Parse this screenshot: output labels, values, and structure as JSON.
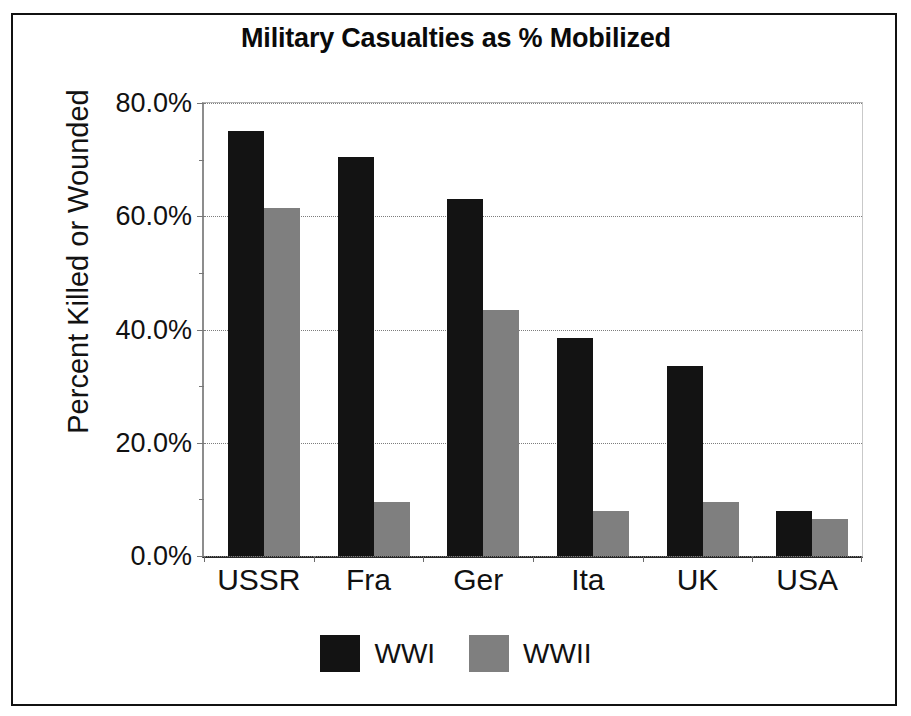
{
  "chart_data": {
    "type": "bar",
    "title": "Military Casualties as % Mobilized",
    "xlabel": "",
    "ylabel": "Percent Killed or Wounded",
    "categories": [
      "USSR",
      "Fra",
      "Ger",
      "Ita",
      "UK",
      "USA"
    ],
    "series": [
      {
        "name": "WWI",
        "color": "#131313",
        "values": [
          75.0,
          70.5,
          63.0,
          38.5,
          33.5,
          8.0
        ]
      },
      {
        "name": "WWII",
        "color": "#7f7f7f",
        "values": [
          61.5,
          9.5,
          43.5,
          8.0,
          9.5,
          6.5
        ]
      }
    ],
    "ylim": [
      0,
      80
    ],
    "y_ticks": [
      0,
      20,
      40,
      60,
      80
    ],
    "y_tick_labels": [
      "0.0%",
      "20.0%",
      "40.0%",
      "60.0%",
      "80.0%"
    ],
    "y_minor_ticks": [
      10,
      30,
      50,
      70
    ],
    "grid": true,
    "legend_position": "bottom"
  },
  "legend": {
    "items": [
      {
        "label": "WWI",
        "color": "#131313"
      },
      {
        "label": "WWII",
        "color": "#7f7f7f"
      }
    ]
  },
  "axis": {
    "y_labels": [
      "80.0%",
      "60.0%",
      "40.0%",
      "20.0%",
      "0.0%"
    ],
    "x_labels": [
      "USSR",
      "Fra",
      "Ger",
      "Ita",
      "UK",
      "USA"
    ],
    "y_title": "Percent Killed or Wounded"
  },
  "colors": {
    "wwi": "#131313",
    "wwii": "#7f7f7f",
    "frame": "#111111",
    "grid": "#9a9a9a",
    "text": "#111111"
  }
}
